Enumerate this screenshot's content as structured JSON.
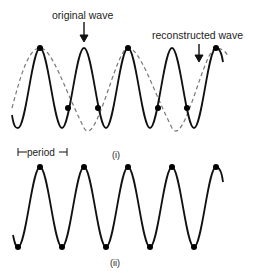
{
  "figure": {
    "panel_i": {
      "label_original": "original wave",
      "label_reconstructed": "reconstructed wave",
      "label_period": "period",
      "caption": "(i)"
    },
    "panel_ii": {
      "caption": "(ii)"
    },
    "colors": {
      "wave": "#111111",
      "reconstructed": "#777777",
      "dot": "#000000"
    }
  }
}
